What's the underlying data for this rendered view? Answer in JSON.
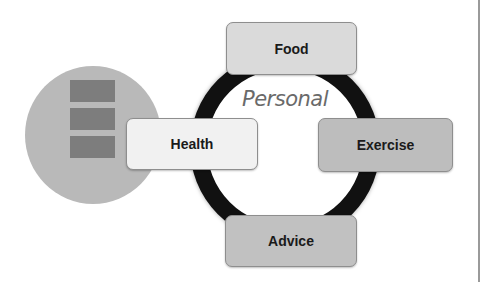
{
  "diagram": {
    "center_label": "Personal",
    "nodes": [
      {
        "id": "food",
        "label": "Food",
        "position": "top"
      },
      {
        "id": "health",
        "label": "Health",
        "position": "left"
      },
      {
        "id": "exercise",
        "label": "Exercise",
        "position": "right"
      },
      {
        "id": "advice",
        "label": "Advice",
        "position": "bottom"
      }
    ],
    "side_graphic": {
      "shape": "circle",
      "stacked_blocks": 3
    }
  },
  "colors": {
    "ring": "#111111",
    "side_circle": "#b9b9b9",
    "blocks": "#7d7d7d",
    "food_fill": "#dadada",
    "health_fill": "#f1f1f1",
    "exercise_fill": "#bdbdbd",
    "advice_fill": "#c1c1c1",
    "center_label": "#6a6a6a"
  }
}
